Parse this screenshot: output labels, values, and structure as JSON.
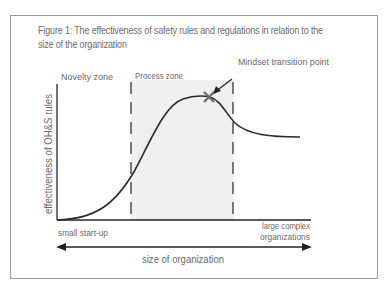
{
  "figure": {
    "caption": "Figure 1: The effectiveness of safety rules and regulations in relation to the size of the organization",
    "zones": {
      "novelty": "Novelty zone",
      "process": "Process zone"
    },
    "annotation": "Mindset transition point",
    "y_axis_label": "effectiveness of OH&S rules",
    "x_axis": {
      "left_label": "small start-up",
      "right_label_line1": "large complex",
      "right_label_line2": "organizations",
      "arrow_label": "size of organization"
    },
    "colors": {
      "curve": "#2a2a2a",
      "marker": "#6e6e6e",
      "process_zone_fill": "#efefef",
      "text": "#6a6a6a",
      "frame": "#9a9a9a"
    }
  }
}
